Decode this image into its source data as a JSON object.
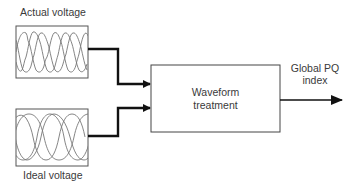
{
  "diagram": {
    "inputs": [
      {
        "id": "actual",
        "label": "Actual voltage",
        "waveform": "distorted-three-phase"
      },
      {
        "id": "ideal",
        "label": "Ideal voltage",
        "waveform": "sinusoidal-three-phase"
      }
    ],
    "process": {
      "label_line1": "Waveform",
      "label_line2": "treatment"
    },
    "output": {
      "label_line1": "Global PQ",
      "label_line2": "index"
    },
    "colors": {
      "stroke": "#111111",
      "box_stroke": "#555555",
      "wave": "#777777",
      "text": "#3a3a3a"
    }
  }
}
